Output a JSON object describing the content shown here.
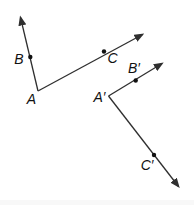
{
  "figure": {
    "canvas": {
      "width": 194,
      "height": 211,
      "background": "#ffffff"
    },
    "style": {
      "line_color": "#2f2f2f",
      "dot_color": "#111111",
      "label_color": "#111111",
      "edge_band_color": "#f3f3f3"
    },
    "angles": [
      {
        "name": "angle-BAC",
        "vertex": {
          "x": 38,
          "y": 91,
          "label": "A",
          "label_name": "label-A",
          "label_x": 31.5,
          "label_y": 104
        },
        "rays": [
          {
            "name": "ray-A-B",
            "tip_x": 20.5,
            "tip_y": 17.5,
            "point": {
              "name": "point-B",
              "x": 30.3,
              "y": 57,
              "label": "B",
              "label_name": "label-B",
              "label_x": 19,
              "label_y": 64
            }
          },
          {
            "name": "ray-A-C",
            "tip_x": 142.5,
            "tip_y": 34.5,
            "point": {
              "name": "point-C",
              "x": 104,
              "y": 51.5,
              "label": "C",
              "label_name": "label-C",
              "label_x": 112.5,
              "label_y": 62.5
            }
          }
        ]
      },
      {
        "name": "angle-B-prime-A-prime-C-prime",
        "vertex": {
          "x": 108.5,
          "y": 96,
          "label": "A′",
          "label_name": "label-A-prime",
          "label_x": 99.5,
          "label_y": 102
        },
        "rays": [
          {
            "name": "ray-A-prime-B-prime",
            "tip_x": 162,
            "tip_y": 63.5,
            "point": {
              "name": "point-B-prime",
              "x": 135.7,
              "y": 80.5,
              "label": "B′",
              "label_name": "label-B-prime",
              "label_x": 134,
              "label_y": 73
            }
          },
          {
            "name": "ray-A-prime-C-prime",
            "tip_x": 178.5,
            "tip_y": 186.5,
            "point": {
              "name": "point-C-prime",
              "x": 154,
              "y": 155,
              "label": "C′",
              "label_name": "label-C-prime",
              "label_x": 147,
              "label_y": 170
            }
          }
        ]
      }
    ]
  }
}
